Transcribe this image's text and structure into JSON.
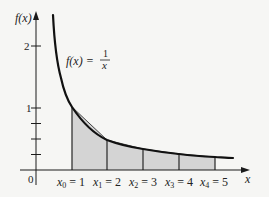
{
  "figure": {
    "function_label": {
      "lhs": "f(x) =",
      "num": "1",
      "den": "x"
    },
    "y_axis": {
      "label": "f(x)",
      "ticks": [
        {
          "value": 2,
          "label": "2"
        },
        {
          "value": 1,
          "label": "1"
        }
      ],
      "minor_ticks": [
        0.25,
        0.5,
        0.75
      ]
    },
    "x_axis": {
      "label": "x",
      "origin_label": "0"
    },
    "partition_points": [
      {
        "name": "x",
        "sub": "0",
        "value": "1"
      },
      {
        "name": "x",
        "sub": "1",
        "value": "2"
      },
      {
        "name": "x",
        "sub": "2",
        "value": "3"
      },
      {
        "name": "x",
        "sub": "3",
        "value": "4"
      },
      {
        "name": "x",
        "sub": "4",
        "value": "5"
      }
    ],
    "colors": {
      "shade": "#d4d4d4",
      "line": "#1a1a1a",
      "background": "#f6f6f4"
    }
  }
}
